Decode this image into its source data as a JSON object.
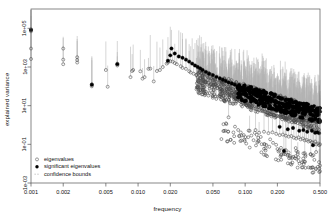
{
  "chart_data": {
    "type": "scatter",
    "title": "",
    "xlabel": "frequency",
    "ylabel": "explained variance",
    "xscale": "log",
    "yscale": "log",
    "xlim": [
      0.001,
      0.5
    ],
    "ylim": [
      0.001,
      1000000.0
    ],
    "xticks": [
      0.001,
      0.002,
      0.005,
      0.01,
      0.02,
      0.05,
      0.1,
      0.2,
      0.5
    ],
    "xticklabels": [
      "0.001",
      "0.002",
      "0.005",
      "0.010",
      "0.020",
      "0.050",
      "0.100",
      "0.200",
      "0.500"
    ],
    "yticks": [
      100000.0,
      1000.0,
      10.0,
      0.1,
      0.001
    ],
    "yticklabels": [
      "1e+05",
      "1e+03",
      "1e+01",
      "1e-01",
      "1e-03"
    ],
    "grid": false,
    "legend_position": "bottom-left",
    "legend": [
      {
        "label": "eigenvalues",
        "marker": "open-circle",
        "color": "#555555"
      },
      {
        "label": "significant eigenvalues",
        "marker": "filled-circle",
        "color": "#000000"
      },
      {
        "label": "confidence bounds",
        "marker": "dashed-line",
        "color": "#aaaaaa"
      }
    ],
    "series": [
      {
        "name": "eigenvalues",
        "marker": "open-circle",
        "color": "#555555",
        "points": [
          [
            0.001,
            90000
          ],
          [
            0.001,
            70000
          ],
          [
            0.001,
            2600
          ],
          [
            0.001,
            9000
          ],
          [
            0.002,
            9000
          ],
          [
            0.002,
            2400
          ],
          [
            0.002,
            1400
          ],
          [
            0.0027,
            3200
          ],
          [
            0.0027,
            2300
          ],
          [
            0.0027,
            1700
          ],
          [
            0.0037,
            130
          ],
          [
            0.0037,
            100
          ],
          [
            0.005,
            700
          ],
          [
            0.0052,
            95
          ],
          [
            0.0064,
            1500
          ],
          [
            0.0064,
            1200
          ],
          [
            0.0085,
            300
          ],
          [
            0.0088,
            620
          ],
          [
            0.009,
            700
          ],
          [
            0.0105,
            600
          ],
          [
            0.011,
            250
          ],
          [
            0.0115,
            300
          ],
          [
            0.0125,
            800
          ],
          [
            0.013,
            820
          ],
          [
            0.014,
            180
          ],
          [
            0.015,
            620
          ],
          [
            0.016,
            700
          ],
          [
            0.017,
            1000
          ],
          [
            0.0185,
            1500
          ],
          [
            0.019,
            1700
          ],
          [
            0.02,
            2000
          ],
          [
            0.021,
            1900
          ],
          [
            0.022,
            1600
          ],
          [
            0.023,
            1400
          ],
          [
            0.025,
            1100
          ],
          [
            0.026,
            900
          ],
          [
            0.028,
            800
          ],
          [
            0.03,
            600
          ],
          [
            0.031,
            520
          ],
          [
            0.033,
            450
          ],
          [
            0.035,
            380
          ],
          [
            0.036,
            300
          ],
          [
            0.038,
            260
          ],
          [
            0.04,
            220
          ],
          [
            0.04,
            60
          ],
          [
            0.042,
            180
          ],
          [
            0.045,
            150
          ],
          [
            0.048,
            130
          ],
          [
            0.05,
            110
          ],
          [
            0.052,
            95
          ],
          [
            0.055,
            80
          ],
          [
            0.058,
            70
          ],
          [
            0.06,
            60
          ],
          [
            0.062,
            55
          ],
          [
            0.065,
            48
          ],
          [
            0.068,
            42
          ],
          [
            0.07,
            38
          ],
          [
            0.07,
            2.5
          ],
          [
            0.072,
            35
          ],
          [
            0.075,
            30
          ],
          [
            0.078,
            28
          ],
          [
            0.08,
            26
          ],
          [
            0.082,
            23
          ],
          [
            0.085,
            20
          ],
          [
            0.088,
            18
          ],
          [
            0.09,
            17
          ],
          [
            0.092,
            15
          ],
          [
            0.095,
            14
          ],
          [
            0.098,
            13
          ],
          [
            0.1,
            12
          ],
          [
            0.102,
            11
          ],
          [
            0.105,
            10
          ],
          [
            0.108,
            9.5
          ],
          [
            0.11,
            9
          ],
          [
            0.115,
            8
          ],
          [
            0.12,
            7.5
          ],
          [
            0.125,
            7
          ],
          [
            0.13,
            6.5
          ],
          [
            0.135,
            6
          ],
          [
            0.14,
            5.5
          ],
          [
            0.145,
            5.2
          ],
          [
            0.15,
            5
          ],
          [
            0.155,
            4.6
          ],
          [
            0.16,
            4.3
          ],
          [
            0.165,
            4
          ],
          [
            0.17,
            3.8
          ],
          [
            0.175,
            3.6
          ],
          [
            0.18,
            3.4
          ],
          [
            0.185,
            3.2
          ],
          [
            0.19,
            3.1
          ],
          [
            0.195,
            3
          ],
          [
            0.2,
            2.9
          ],
          [
            0.21,
            2.7
          ],
          [
            0.22,
            2.6
          ],
          [
            0.23,
            2.5
          ],
          [
            0.24,
            2.4
          ],
          [
            0.25,
            2.3
          ],
          [
            0.26,
            2.2
          ],
          [
            0.27,
            2.1
          ],
          [
            0.28,
            2.05
          ],
          [
            0.29,
            2
          ],
          [
            0.3,
            1.95
          ],
          [
            0.31,
            1.9
          ],
          [
            0.32,
            1.85
          ],
          [
            0.33,
            1.8
          ],
          [
            0.34,
            1.78
          ],
          [
            0.35,
            1.75
          ],
          [
            0.36,
            1.72
          ],
          [
            0.37,
            1.7
          ],
          [
            0.38,
            1.68
          ],
          [
            0.39,
            1.65
          ],
          [
            0.4,
            1.62
          ],
          [
            0.41,
            1.6
          ],
          [
            0.42,
            1.58
          ],
          [
            0.43,
            1.55
          ],
          [
            0.44,
            1.53
          ],
          [
            0.45,
            1.5
          ],
          [
            0.46,
            1.48
          ],
          [
            0.47,
            1.45
          ],
          [
            0.48,
            1.43
          ],
          [
            0.49,
            1.4
          ],
          [
            0.5,
            1.38
          ],
          [
            0.11,
            0.5
          ],
          [
            0.125,
            0.55
          ],
          [
            0.135,
            0.4
          ],
          [
            0.15,
            0.45
          ],
          [
            0.165,
            0.38
          ],
          [
            0.18,
            0.42
          ],
          [
            0.195,
            0.35
          ],
          [
            0.21,
            0.3
          ],
          [
            0.225,
            0.32
          ],
          [
            0.24,
            0.28
          ],
          [
            0.255,
            0.25
          ],
          [
            0.27,
            0.27
          ],
          [
            0.285,
            0.22
          ],
          [
            0.3,
            0.2
          ],
          [
            0.315,
            0.23
          ],
          [
            0.33,
            0.18
          ],
          [
            0.345,
            0.2
          ],
          [
            0.36,
            0.16
          ],
          [
            0.375,
            0.17
          ],
          [
            0.39,
            0.14
          ],
          [
            0.405,
            0.15
          ],
          [
            0.42,
            0.13
          ],
          [
            0.435,
            0.12
          ],
          [
            0.45,
            0.14
          ],
          [
            0.465,
            0.1
          ],
          [
            0.48,
            0.11
          ],
          [
            0.49,
            0.09
          ],
          [
            0.5,
            0.1
          ],
          [
            0.24,
            0.05
          ],
          [
            0.31,
            0.04
          ],
          [
            0.36,
            0.035
          ],
          [
            0.41,
            0.03
          ],
          [
            0.46,
            0.04
          ],
          [
            0.49,
            0.012
          ],
          [
            0.5,
            0.008
          ],
          [
            0.5,
            0.004
          ],
          [
            0.27,
            0.009
          ]
        ]
      },
      {
        "name": "significant eigenvalues",
        "marker": "filled-circle",
        "color": "#000000",
        "points": [
          [
            0.001,
            82000
          ],
          [
            0.0037,
            120
          ],
          [
            0.0064,
            1400
          ],
          [
            0.019,
            2100
          ],
          [
            0.02,
            4000
          ],
          [
            0.0205,
            9000
          ],
          [
            0.022,
            5000
          ],
          [
            0.024,
            3500
          ],
          [
            0.026,
            3000
          ],
          [
            0.028,
            2400
          ],
          [
            0.03,
            1900
          ],
          [
            0.032,
            1500
          ],
          [
            0.034,
            1200
          ],
          [
            0.036,
            1000
          ],
          [
            0.038,
            850
          ],
          [
            0.04,
            700
          ],
          [
            0.043,
            560
          ],
          [
            0.046,
            450
          ],
          [
            0.05,
            380
          ],
          [
            0.054,
            310
          ],
          [
            0.058,
            260
          ],
          [
            0.062,
            220
          ],
          [
            0.066,
            190
          ],
          [
            0.07,
            160
          ],
          [
            0.075,
            140
          ],
          [
            0.08,
            120
          ],
          [
            0.085,
            100
          ],
          [
            0.09,
            90
          ],
          [
            0.095,
            80
          ],
          [
            0.1,
            70
          ],
          [
            0.105,
            62
          ],
          [
            0.11,
            55
          ],
          [
            0.115,
            48
          ],
          [
            0.12,
            44
          ],
          [
            0.125,
            40
          ],
          [
            0.13,
            36
          ],
          [
            0.135,
            33
          ],
          [
            0.14,
            30
          ],
          [
            0.145,
            28
          ],
          [
            0.15,
            26
          ],
          [
            0.155,
            24
          ],
          [
            0.16,
            22
          ],
          [
            0.17,
            20
          ],
          [
            0.18,
            18
          ],
          [
            0.19,
            16
          ],
          [
            0.2,
            15
          ],
          [
            0.21,
            14
          ],
          [
            0.22,
            13
          ],
          [
            0.23,
            12
          ],
          [
            0.24,
            11
          ],
          [
            0.25,
            10.5
          ],
          [
            0.26,
            10
          ],
          [
            0.27,
            9.5
          ],
          [
            0.28,
            9
          ],
          [
            0.29,
            8.6
          ],
          [
            0.3,
            8.3
          ],
          [
            0.31,
            8
          ],
          [
            0.32,
            7.7
          ],
          [
            0.33,
            7.4
          ],
          [
            0.34,
            7.2
          ],
          [
            0.35,
            7
          ],
          [
            0.36,
            6.8
          ],
          [
            0.37,
            6.6
          ],
          [
            0.38,
            6.4
          ],
          [
            0.39,
            6.2
          ],
          [
            0.4,
            6
          ],
          [
            0.41,
            5.9
          ],
          [
            0.42,
            5.8
          ],
          [
            0.43,
            5.6
          ],
          [
            0.44,
            5.5
          ],
          [
            0.45,
            5.4
          ],
          [
            0.46,
            5.3
          ],
          [
            0.47,
            5.2
          ],
          [
            0.48,
            5.1
          ],
          [
            0.49,
            5
          ],
          [
            0.5,
            4.9
          ],
          [
            0.21,
            0.8
          ],
          [
            0.25,
            0.6
          ],
          [
            0.28,
            0.7
          ],
          [
            0.32,
            0.5
          ],
          [
            0.35,
            0.55
          ],
          [
            0.38,
            0.45
          ],
          [
            0.42,
            0.5
          ],
          [
            0.45,
            0.4
          ],
          [
            0.47,
            0.42
          ],
          [
            0.49,
            0.38
          ],
          [
            0.23,
            0.045
          ],
          [
            0.43,
            0.09
          ]
        ]
      }
    ],
    "confidence_bounds_note": "vertical gray segments from each eigenvalue up to its upper bound"
  },
  "axes": {
    "xlabel": "frequency",
    "ylabel": "explained variance"
  }
}
